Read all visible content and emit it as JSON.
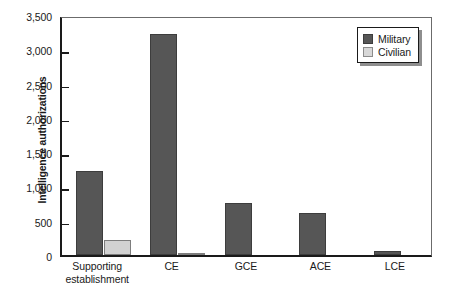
{
  "chart_data": {
    "type": "bar",
    "title": "",
    "xlabel": "",
    "ylabel": "Intelligence authorizations",
    "categories": [
      "Supporting establishment",
      "CE",
      "GCE",
      "ACE",
      "LCE"
    ],
    "category_lines": [
      [
        "Supporting",
        "establishment"
      ],
      [
        "CE"
      ],
      [
        "GCE"
      ],
      [
        "ACE"
      ],
      [
        "LCE"
      ]
    ],
    "series": [
      {
        "name": "Military",
        "color": "#565656",
        "values": [
          1220,
          3230,
          755,
          620,
          60
        ]
      },
      {
        "name": "Civilian",
        "color": "#d2d2d2",
        "values": [
          220,
          25,
          0,
          0,
          0
        ]
      }
    ],
    "ylim": [
      0,
      3500
    ],
    "y_ticks": [
      0,
      500,
      1000,
      1500,
      2000,
      2500,
      3000,
      3500
    ],
    "y_tick_labels": [
      "0",
      "500",
      "1,000",
      "1,500",
      "2,000",
      "2,500",
      "3,000",
      "3,500"
    ],
    "grid": false,
    "legend_position": "top-right",
    "legend_entries": [
      "Military",
      "Civilian"
    ]
  }
}
